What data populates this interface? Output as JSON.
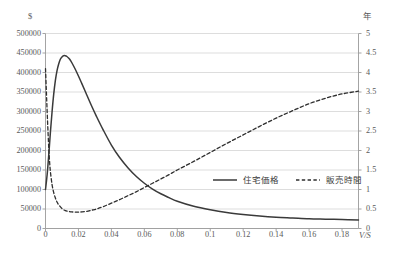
{
  "chart_data": {
    "type": "line",
    "title": "",
    "xlabel": "V/S",
    "ylabel": "$",
    "y2label": "年",
    "xlim": [
      0,
      0.19
    ],
    "ylim": [
      0,
      500000
    ],
    "y2lim": [
      0,
      5
    ],
    "grid": true,
    "legend_position": "inside-right",
    "xticks": [
      "0",
      "0.02",
      "0.04",
      "0.06",
      "0.08",
      "0.1",
      "0.12",
      "0.14",
      "0.16",
      "0.18"
    ],
    "xtick_values": [
      0,
      0.02,
      0.04,
      0.06,
      0.08,
      0.1,
      0.12,
      0.14,
      0.16,
      0.18
    ],
    "yticks_left": [
      "0",
      "50000",
      "100000",
      "150000",
      "200000",
      "250000",
      "300000",
      "350000",
      "400000",
      "450000",
      "500000"
    ],
    "ytick_left_values": [
      0,
      50000,
      100000,
      150000,
      200000,
      250000,
      300000,
      350000,
      400000,
      450000,
      500000
    ],
    "yticks_right": [
      "0",
      "0.5",
      "1",
      "1.5",
      "2",
      "2.5",
      "3",
      "3.5",
      "4",
      "4.5",
      "5"
    ],
    "ytick_right_values": [
      0,
      0.5,
      1,
      1.5,
      2,
      2.5,
      3,
      3.5,
      4,
      4.5,
      5
    ],
    "series": [
      {
        "name": "住宅価格",
        "axis": "left",
        "style": "solid",
        "color": "#3a3a3a",
        "x": [
          0.0,
          0.001,
          0.002,
          0.003,
          0.004,
          0.005,
          0.006,
          0.007,
          0.008,
          0.009,
          0.01,
          0.011,
          0.012,
          0.013,
          0.014,
          0.015,
          0.016,
          0.018,
          0.02,
          0.022,
          0.025,
          0.028,
          0.031,
          0.035,
          0.04,
          0.045,
          0.05,
          0.055,
          0.06,
          0.065,
          0.07,
          0.075,
          0.08,
          0.09,
          0.1,
          0.11,
          0.12,
          0.13,
          0.14,
          0.15,
          0.16,
          0.17,
          0.18,
          0.19
        ],
        "y": [
          100000,
          138000,
          190000,
          248000,
          300000,
          345000,
          380000,
          405000,
          422000,
          434000,
          440000,
          443000,
          443000,
          441000,
          437000,
          432000,
          425000,
          409000,
          391000,
          372000,
          343000,
          314000,
          287000,
          253000,
          214000,
          182000,
          156000,
          134000,
          116000,
          101000,
          89000,
          79000,
          70000,
          57000,
          48000,
          41000,
          36000,
          32000,
          29000,
          27000,
          25000,
          24000,
          23000,
          22000
        ]
      },
      {
        "name": "販売時間",
        "axis": "right",
        "style": "dashed",
        "color": "#2e2e2e",
        "x": [
          0.0,
          0.0005,
          0.001,
          0.0015,
          0.002,
          0.0025,
          0.003,
          0.004,
          0.005,
          0.006,
          0.007,
          0.008,
          0.01,
          0.012,
          0.014,
          0.016,
          0.018,
          0.02,
          0.022,
          0.025,
          0.028,
          0.031,
          0.035,
          0.04,
          0.045,
          0.05,
          0.055,
          0.06,
          0.065,
          0.07,
          0.075,
          0.08,
          0.09,
          0.1,
          0.11,
          0.12,
          0.13,
          0.14,
          0.15,
          0.16,
          0.17,
          0.18,
          0.19
        ],
        "y": [
          4.1,
          3.55,
          3.0,
          2.5,
          2.05,
          1.7,
          1.45,
          1.12,
          0.92,
          0.78,
          0.68,
          0.61,
          0.51,
          0.46,
          0.44,
          0.425,
          0.42,
          0.42,
          0.425,
          0.44,
          0.47,
          0.5,
          0.56,
          0.65,
          0.74,
          0.84,
          0.94,
          1.05,
          1.16,
          1.27,
          1.38,
          1.5,
          1.72,
          1.95,
          2.18,
          2.4,
          2.62,
          2.83,
          3.02,
          3.2,
          3.34,
          3.45,
          3.52
        ]
      }
    ],
    "legend": [
      {
        "label": "住宅価格",
        "style": "solid"
      },
      {
        "label": "販売時間",
        "style": "dashed"
      }
    ]
  }
}
